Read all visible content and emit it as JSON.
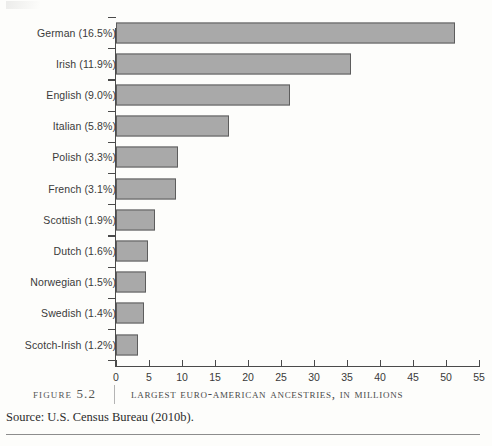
{
  "chart_data": {
    "type": "bar",
    "orientation": "horizontal",
    "title": "Largest Euro-American Ancestries, in Millions",
    "xlabel": "",
    "ylabel": "",
    "xlim": [
      0,
      55
    ],
    "xticks": [
      0,
      5,
      10,
      15,
      20,
      25,
      30,
      35,
      40,
      45,
      50,
      55
    ],
    "grid": false,
    "legend": false,
    "categories": [
      "German (16.5%)",
      "Irish (11.9%)",
      "English (9.0%)",
      "Italian (5.8%)",
      "Polish (3.3%)",
      "French (3.1%)",
      "Scottish (1.9%)",
      "Dutch (1.6%)",
      "Norwegian (1.5%)",
      "Swedish (1.4%)",
      "Scotch-Irish (1.2%)"
    ],
    "values": [
      51.3,
      35.6,
      26.3,
      17.1,
      9.4,
      9.1,
      5.9,
      4.8,
      4.6,
      4.3,
      3.3
    ],
    "percents": [
      16.5,
      11.9,
      9.0,
      5.8,
      3.3,
      3.1,
      1.9,
      1.6,
      1.5,
      1.4,
      1.2
    ],
    "bar_color": "#a9a9a9",
    "bar_border_color": "#5d5d5d",
    "axis_color": "#4a4a4a"
  },
  "caption": {
    "figure_number": "Figure 5.2",
    "title": "Largest Euro-American Ancestries, in Millions",
    "source": "Source: U.S. Census Bureau (2010b)."
  }
}
